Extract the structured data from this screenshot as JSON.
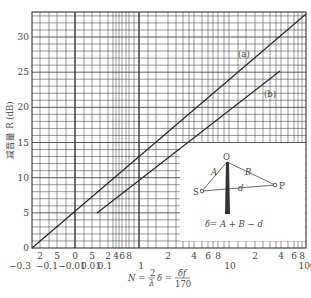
{
  "chart_data": {
    "type": "line",
    "title": "",
    "xlabel": "N = (2/λ)δ = δf/170",
    "ylabel": "减音量 R (dB)",
    "x_scale": "log (with negative/near-zero region on left)",
    "x_tick_labels_top": [
      "2",
      "5",
      "0",
      "5",
      "2",
      "4",
      "6",
      "8",
      "2",
      "4",
      "6",
      "8",
      "2",
      "4",
      "6",
      "8"
    ],
    "x_tick_labels_bottom": [
      "-0.3",
      "-0.1",
      "-0.01",
      "0.01",
      "0.1",
      "1",
      "10",
      "100"
    ],
    "y_ticks": [
      0,
      5,
      10,
      15,
      20,
      25,
      30
    ],
    "ylim": [
      0,
      33.5
    ],
    "grid": true,
    "series": [
      {
        "name": "(a)",
        "points": [
          {
            "x": -0.3,
            "y": 0
          },
          {
            "x": 0,
            "y": 5
          },
          {
            "x": 1,
            "y": 13
          },
          {
            "x": 10,
            "y": 23
          },
          {
            "x": 100,
            "y": 33
          }
        ]
      },
      {
        "name": "(b)",
        "points": [
          {
            "x": 0.05,
            "y": 5
          },
          {
            "x": 1,
            "y": 9.5
          },
          {
            "x": 10,
            "y": 18.5
          },
          {
            "x": 40,
            "y": 25
          }
        ]
      }
    ],
    "inset": {
      "labels": [
        "O",
        "S",
        "P",
        "A",
        "B",
        "d"
      ],
      "formula": "δ= A + B − d"
    }
  },
  "labels": {
    "y_axis": "减音量 R (dB)",
    "x_axis_main": "N = ",
    "x_frac1_num": "2",
    "x_frac1_den": "λ",
    "x_mid": "δ = ",
    "x_frac2_num": "δf",
    "x_frac2_den": "170",
    "series_a": "(a)",
    "series_b": "(b)",
    "inset_O": "O",
    "inset_S": "S",
    "inset_P": "P",
    "inset_A": "A",
    "inset_B": "B",
    "inset_d": "d",
    "inset_formula": "δ= A + B − d"
  },
  "y_ticks": [
    "0",
    "5",
    "10",
    "15",
    "20",
    "25",
    "30"
  ],
  "x_top": [
    "2",
    "5",
    "0",
    "5",
    "2",
    "4",
    "6",
    "8",
    "2",
    "4",
    "6",
    "8",
    "2",
    "4",
    "6",
    "8"
  ],
  "x_bottom": [
    "−0.3",
    "−0.1",
    "−0.01",
    "0.01",
    "0.1",
    "1",
    "10",
    "100"
  ]
}
